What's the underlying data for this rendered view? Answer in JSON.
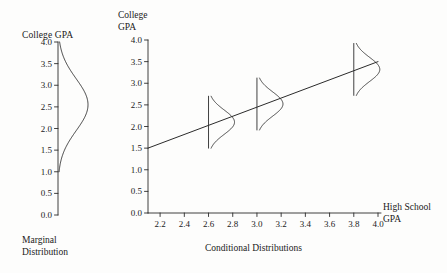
{
  "figure": {
    "background": "#fdfdfc",
    "ink": "#1a1a1a"
  },
  "marginal_panel": {
    "title": "College GPA",
    "caption": "Marginal\nDistribution",
    "y_axis": {
      "ticks": [
        "4.0",
        "3.5",
        "3.0",
        "2.5",
        "2.0",
        "1.5",
        "1.0",
        "0.5",
        "0.0"
      ],
      "values": [
        4.0,
        3.5,
        3.0,
        2.5,
        2.0,
        1.5,
        1.0,
        0.5,
        0.0
      ]
    }
  },
  "conditional_panel": {
    "y_axis_title": "College\nGPA",
    "x_axis_title": "High School\nGPA",
    "caption": "Conditional Distributions",
    "y_axis": {
      "ticks": [
        "4.0",
        "3.5",
        "3.0",
        "2.5",
        "2.0",
        "1.5",
        "1.0",
        "0.5",
        "0.0"
      ],
      "values": [
        4.0,
        3.5,
        3.0,
        2.5,
        2.0,
        1.5,
        1.0,
        0.5,
        0.0
      ]
    },
    "x_axis": {
      "ticks": [
        "2.2",
        "2.4",
        "2.6",
        "2.8",
        "3.0",
        "3.2",
        "3.4",
        "3.6",
        "3.8",
        "4.0"
      ],
      "values": [
        2.2,
        2.4,
        2.6,
        2.8,
        3.0,
        3.2,
        3.4,
        3.6,
        3.8,
        4.0
      ]
    }
  },
  "chart_data": {
    "type": "line",
    "title": "",
    "xlabel": "High School GPA",
    "ylabel": "College GPA",
    "xlim": [
      2.1,
      4.0
    ],
    "ylim": [
      0.0,
      4.0
    ],
    "grid": false,
    "legend": null,
    "annotations": [
      "Marginal Distribution",
      "Conditional Distributions"
    ],
    "series": [
      {
        "name": "Regression line",
        "type": "line",
        "x": [
          2.1,
          4.0
        ],
        "y": [
          1.5,
          3.5
        ]
      },
      {
        "name": "Marginal distribution of College GPA",
        "type": "density",
        "orientation": "vertical",
        "mean": 2.55,
        "sd": 0.6,
        "range": [
          1.0,
          4.0
        ]
      }
    ],
    "conditional_distributions": [
      {
        "hs_gpa": 2.6,
        "mean_college_gpa": 2.1,
        "sd": 0.28,
        "range": [
          1.5,
          2.7
        ]
      },
      {
        "hs_gpa": 3.0,
        "mean_college_gpa": 2.52,
        "sd": 0.28,
        "range": [
          1.92,
          3.12
        ]
      },
      {
        "hs_gpa": 3.8,
        "mean_college_gpa": 3.32,
        "sd": 0.28,
        "range": [
          2.72,
          3.92
        ]
      }
    ]
  }
}
